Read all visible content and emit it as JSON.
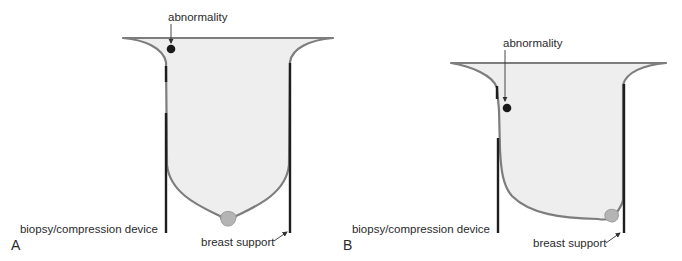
{
  "figure": {
    "panels": [
      {
        "letter": "A",
        "labels": {
          "abnormality": "abnormality",
          "device": "biopsy/compression device",
          "support": "breast support"
        }
      },
      {
        "letter": "B",
        "labels": {
          "abnormality": "abnormality",
          "device": "biopsy/compression device",
          "support": "breast support"
        }
      }
    ],
    "colors": {
      "tissue_fill": "#eeeeee",
      "tissue_outline": "#7d7d7d",
      "plate": "#1e1e1e",
      "lesion": "#1a1a1a",
      "nipple": "#b4b4b4"
    }
  }
}
